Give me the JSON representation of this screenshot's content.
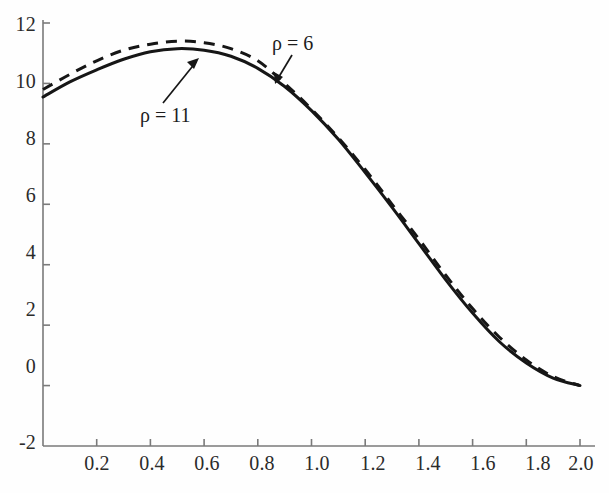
{
  "chart_data": {
    "type": "line",
    "title": "",
    "xlabel": "",
    "ylabel": "",
    "xlim": [
      0.0,
      2.0
    ],
    "ylim": [
      -2,
      12
    ],
    "grid": false,
    "legend_position": "inline-annotation",
    "x_ticks": [
      "0.2",
      "0.4",
      "0.6",
      "0.8",
      "1.0",
      "1.2",
      "1.4",
      "1.6",
      "1.8",
      "2.0"
    ],
    "x_tick_values": [
      0.2,
      0.4,
      0.6,
      0.8,
      1.0,
      1.2,
      1.4,
      1.6,
      1.8,
      2.0
    ],
    "y_ticks": [
      "12",
      "10",
      "8",
      "6",
      "4",
      "2",
      "0",
      "-2"
    ],
    "y_tick_values": [
      12,
      10,
      8,
      6,
      4,
      2,
      0,
      -2
    ],
    "series": [
      {
        "name": "rho = 11",
        "style": "solid",
        "color": "#161616",
        "x": [
          0.0,
          0.1,
          0.2,
          0.3,
          0.4,
          0.5,
          0.6,
          0.7,
          0.8,
          0.9,
          1.0,
          1.1,
          1.2,
          1.3,
          1.4,
          1.5,
          1.6,
          1.7,
          1.8,
          1.9,
          2.0
        ],
        "y": [
          9.55,
          10.05,
          10.45,
          10.8,
          11.05,
          11.15,
          11.1,
          10.9,
          10.5,
          9.9,
          9.1,
          8.15,
          7.05,
          5.9,
          4.7,
          3.5,
          2.4,
          1.45,
          0.75,
          0.25,
          0.0
        ]
      },
      {
        "name": "rho = 6",
        "style": "dashed",
        "color": "#161616",
        "x": [
          0.0,
          0.1,
          0.2,
          0.3,
          0.4,
          0.5,
          0.6,
          0.7,
          0.8,
          0.9,
          1.0,
          1.1,
          1.2,
          1.3,
          1.4,
          1.5,
          1.6,
          1.7,
          1.8,
          1.9,
          2.0
        ],
        "y": [
          9.8,
          10.3,
          10.75,
          11.1,
          11.3,
          11.4,
          11.35,
          11.15,
          10.75,
          10.0,
          9.15,
          8.2,
          7.15,
          6.0,
          4.85,
          3.65,
          2.55,
          1.6,
          0.85,
          0.3,
          0.0
        ]
      }
    ],
    "annotations": [
      {
        "id": "rho-11",
        "text": "ρ = 11",
        "symbol": "ρ",
        "value": "11",
        "target_series": "rho = 11",
        "point_x": 0.55,
        "point_y": 11.15,
        "arrow": "up-right"
      },
      {
        "id": "rho-6",
        "text": "ρ = 6",
        "symbol": "ρ",
        "value": "6",
        "target_series": "rho = 6",
        "point_x": 0.9,
        "point_y": 10.05,
        "arrow": "down-left"
      }
    ]
  },
  "axes": {
    "tick_color": "#6b6b6b",
    "axis_color": "#6b6b6b",
    "background": "#fefefe"
  }
}
